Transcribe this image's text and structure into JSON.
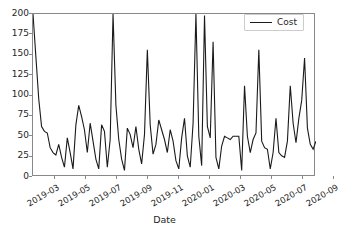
{
  "chart_data": {
    "type": "line",
    "title": "",
    "xlabel": "Date",
    "ylabel": "",
    "ylim": [
      0,
      200
    ],
    "yticks": [
      0,
      25,
      50,
      75,
      100,
      125,
      150,
      175,
      200
    ],
    "xtick_labels": [
      "2019-03",
      "2019-05",
      "2019-07",
      "2019-09",
      "2019-11",
      "2020-01",
      "2020-03",
      "2020-05",
      "2020-07",
      "2020-09"
    ],
    "xlim": [
      "2019-02-01",
      "2020-09-20"
    ],
    "grid": false,
    "legend": {
      "position": "upper right",
      "entries": [
        "Cost"
      ]
    },
    "line_color": "#1a1a1a",
    "series": [
      {
        "name": "Cost",
        "color": "#1a1a1a",
        "values": [
          200,
          148,
          96,
          62,
          56,
          54,
          36,
          30,
          27,
          40,
          24,
          12,
          48,
          30,
          10,
          64,
          88,
          74,
          58,
          30,
          66,
          44,
          22,
          10,
          64,
          56,
          12,
          46,
          200,
          88,
          46,
          22,
          8,
          60,
          52,
          36,
          62,
          34,
          16,
          52,
          156,
          64,
          28,
          40,
          70,
          58,
          46,
          30,
          58,
          44,
          20,
          10,
          48,
          72,
          26,
          12,
          66,
          200,
          50,
          14,
          198,
          62,
          48,
          166,
          24,
          10,
          38,
          50,
          48,
          46,
          50,
          50,
          50,
          8,
          112,
          50,
          30,
          46,
          54,
          156,
          44,
          36,
          34,
          10,
          30,
          72,
          30,
          26,
          24,
          44,
          112,
          66,
          42,
          72,
          94,
          146,
          60,
          40,
          34,
          44
        ]
      }
    ]
  },
  "axis": {
    "xlabel": "Date"
  },
  "legend": {
    "label": "Cost"
  }
}
